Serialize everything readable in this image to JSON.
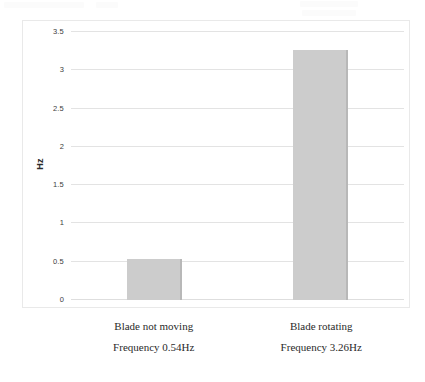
{
  "chart_data": {
    "type": "bar",
    "title": "",
    "subtitle": "",
    "xlabel": "",
    "ylabel": "Hz",
    "categories": [
      "Blade not moving",
      "Blade rotating"
    ],
    "category_sublabels": [
      "Frequency 0.54Hz",
      "Frequency 3.26Hz"
    ],
    "values": [
      0.54,
      3.26
    ],
    "ylim": [
      0,
      3.5
    ],
    "yticks": [
      0,
      0.5,
      1,
      1.5,
      2,
      2.5,
      3,
      3.5
    ],
    "ytick_labels": [
      "0",
      "0.5",
      "1",
      "1.5",
      "2",
      "2.5",
      "3",
      "3.5"
    ],
    "grid": true,
    "legend": "none",
    "bar_color": "#cccccc",
    "bar_edge_color": "#b8b8b8",
    "gridline_color": "#e3e3e3",
    "frame_color": "#e9e9e9",
    "background": "#ffffff"
  },
  "axis": {
    "y_title": "Hz"
  },
  "bars": [
    {
      "label": "Blade not moving",
      "sublabel": "Frequency 0.54Hz",
      "value": 0.54
    },
    {
      "label": "Blade rotating",
      "sublabel": "Frequency 3.26Hz",
      "value": 3.26
    }
  ]
}
